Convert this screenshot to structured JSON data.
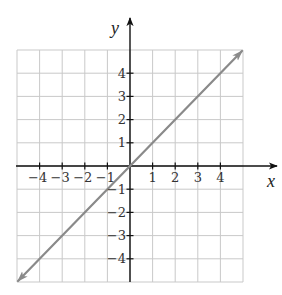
{
  "chart_data": {
    "type": "line",
    "title": "",
    "xlabel": "x",
    "ylabel": "y",
    "xlim": [
      -5,
      5
    ],
    "ylim": [
      -5,
      5
    ],
    "grid": true,
    "x_ticks": [
      -4,
      -3,
      -2,
      -1,
      1,
      2,
      3,
      4
    ],
    "y_ticks": [
      -4,
      -3,
      -2,
      -1,
      1,
      2,
      3,
      4
    ],
    "x_tick_labels": [
      "−4",
      "−3",
      "−2",
      "−1",
      "1",
      "2",
      "3",
      "4"
    ],
    "y_tick_labels": [
      "−4",
      "−3",
      "−2",
      "−1",
      "1",
      "2",
      "3",
      "4"
    ],
    "series": [
      {
        "name": "y = x",
        "x": [
          -5,
          -4,
          -3,
          -2,
          -1,
          0,
          1,
          2,
          3,
          4,
          5
        ],
        "y": [
          -5,
          -4,
          -3,
          -2,
          -1,
          0,
          1,
          2,
          3,
          4,
          5
        ],
        "arrows_both_ends": true,
        "color": "#8a8a8a"
      }
    ],
    "legend": null
  },
  "style": {
    "grid_color": "#c9c9c9",
    "axis_color": "#111111",
    "line_color": "#8a8a8a"
  },
  "layout": {
    "origin_px": [
      130,
      166
    ],
    "unit_x_px": 22.6,
    "unit_y_px": 23.2,
    "x_axis_end_px": 277,
    "y_axis_top_px": 18
  }
}
